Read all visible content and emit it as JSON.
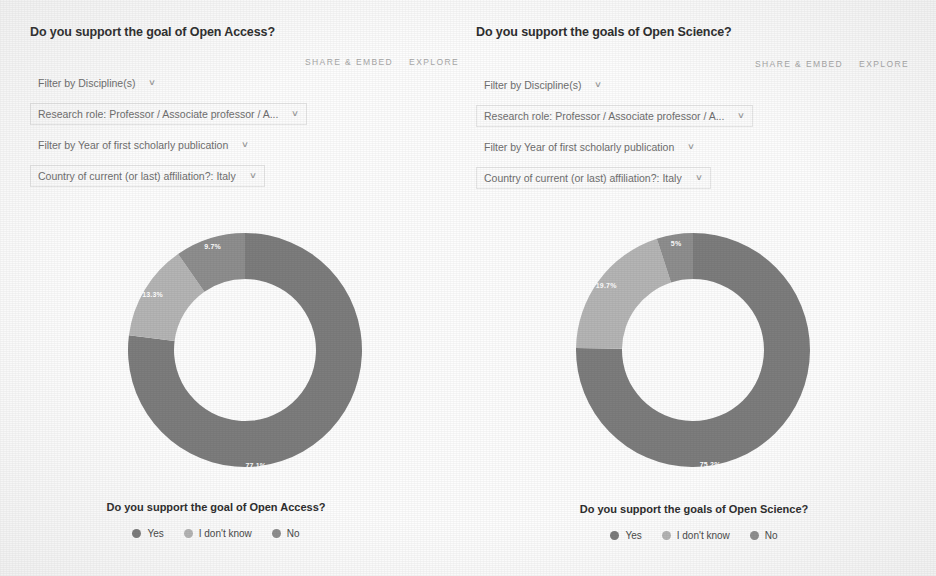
{
  "panels": [
    {
      "title": "Do you support the goal of Open Access?",
      "actions": {
        "share": "SHARE & EMBED",
        "explore": "EXPLORE"
      },
      "filters": [
        {
          "label": "Filter by Discipline(s)",
          "boxed": false
        },
        {
          "label": "Research role: Professor / Associate professor / A...",
          "boxed": true
        },
        {
          "label": "Filter by Year of first scholarly publication",
          "boxed": false
        },
        {
          "label": "Country of current (or last) affiliation?: Italy",
          "boxed": true
        }
      ],
      "caption": "Do you support the goal of Open Access?",
      "legend": [
        {
          "label": "Yes",
          "color": "#7d7d7d"
        },
        {
          "label": "I don't know",
          "color": "#b5b5b5"
        },
        {
          "label": "No",
          "color": "#8e8e8e"
        }
      ]
    },
    {
      "title": "Do you support the goals of Open Science?",
      "actions": {
        "share": "SHARE & EMBED",
        "explore": "EXPLORE"
      },
      "filters": [
        {
          "label": "Filter by Discipline(s)",
          "boxed": false
        },
        {
          "label": "Research role: Professor / Associate professor / A...",
          "boxed": true
        },
        {
          "label": "Filter by Year of first scholarly publication",
          "boxed": false
        },
        {
          "label": "Country of current (or last) affiliation?: Italy",
          "boxed": true
        }
      ],
      "caption": "Do you support the goals of Open Science?",
      "legend": [
        {
          "label": "Yes",
          "color": "#7d7d7d"
        },
        {
          "label": "I don't know",
          "color": "#b5b5b5"
        },
        {
          "label": "No",
          "color": "#8e8e8e"
        }
      ]
    }
  ],
  "icons": {
    "caret": "∨"
  },
  "chart_data": [
    {
      "type": "pie",
      "title": "Do you support the goal of Open Access?",
      "subtitle": "",
      "xlabel": "",
      "ylabel": "",
      "donut": true,
      "legend_position": "bottom",
      "grid": false,
      "categories": [
        "Yes",
        "I don't know",
        "No"
      ],
      "values": [
        77.1,
        13.3,
        9.7
      ],
      "labels": [
        "77.1%",
        "13.3%",
        "9.7%"
      ],
      "colors": [
        "#7d7d7d",
        "#b5b5b5",
        "#8e8e8e"
      ],
      "units": "percent"
    },
    {
      "type": "pie",
      "title": "Do you support the goals of Open Science?",
      "subtitle": "",
      "xlabel": "",
      "ylabel": "",
      "donut": true,
      "legend_position": "bottom",
      "grid": false,
      "categories": [
        "Yes",
        "I don't know",
        "No"
      ],
      "values": [
        75.2,
        19.7,
        5.0
      ],
      "labels": [
        "75.2%",
        "19.7%",
        "5%"
      ],
      "colors": [
        "#7d7d7d",
        "#b5b5b5",
        "#8e8e8e"
      ],
      "units": "percent"
    }
  ]
}
